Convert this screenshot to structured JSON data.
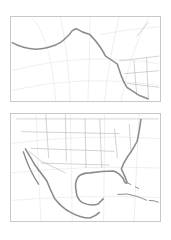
{
  "colors": {
    "background": "#ffffff",
    "frame": "#c8c8c8",
    "graticule": "#e4e4e4",
    "borders": "#b4b4b4",
    "coastline": "#8c8c8c"
  },
  "panels": [
    {
      "id": "pacific-northwest-alaska",
      "region": "Alaska and Pacific coast of North America"
    },
    {
      "id": "contiguous-us-mexico-caribbean",
      "region": "Contiguous United States, Mexico, Gulf of Mexico and Caribbean"
    }
  ]
}
